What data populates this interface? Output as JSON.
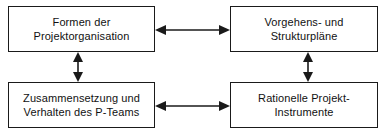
{
  "diagram": {
    "type": "block-diagram",
    "background_color": "#ffffff",
    "line_color": "#1a1a1a",
    "text_color": "#111111",
    "nodes": [
      {
        "id": "formen-der-projektorganisation",
        "label": "Formen der\nProjektorganisation",
        "position": "top-left"
      },
      {
        "id": "vorgehens-und-strukturplaene",
        "label": "Vorgehens- und\nStrukturpläne",
        "position": "top-right"
      },
      {
        "id": "zusammensetzung-und-verhalten-des-p-teams",
        "label": "Zusammensetzung und\nVerhalten des P-Teams",
        "position": "bottom-left"
      },
      {
        "id": "rationelle-projekt-instrumente",
        "label": "Rationelle Projekt-\nInstrumente",
        "position": "bottom-right"
      }
    ],
    "connectors": [
      {
        "id": "top-horizontal",
        "from": "formen-der-projektorganisation",
        "to": "vorgehens-und-strukturplaene",
        "orientation": "horizontal",
        "arrowheads": "both"
      },
      {
        "id": "bottom-horizontal",
        "from": "zusammensetzung-und-verhalten-des-p-teams",
        "to": "rationelle-projekt-instrumente",
        "orientation": "horizontal",
        "arrowheads": "both"
      },
      {
        "id": "left-vertical",
        "from": "formen-der-projektorganisation",
        "to": "zusammensetzung-und-verhalten-des-p-teams",
        "orientation": "vertical",
        "arrowheads": "both"
      },
      {
        "id": "right-vertical",
        "from": "vorgehens-und-strukturplaene",
        "to": "rationelle-projekt-instrumente",
        "orientation": "vertical",
        "arrowheads": "both"
      }
    ]
  }
}
